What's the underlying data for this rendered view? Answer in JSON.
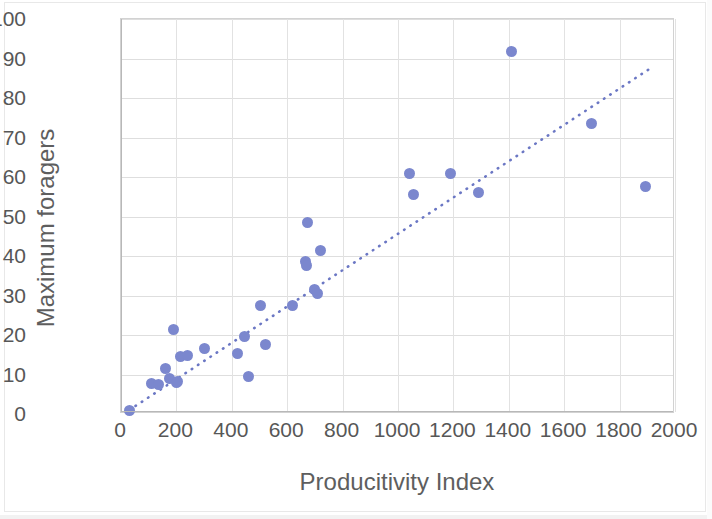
{
  "chart_data": {
    "type": "scatter",
    "title": "",
    "xlabel": "Producitivity Index",
    "ylabel": "Maximum foragers",
    "xlim": [
      0,
      2000
    ],
    "ylim": [
      0,
      100
    ],
    "xticks": [
      0,
      200,
      400,
      600,
      800,
      1000,
      1200,
      1400,
      1600,
      1800,
      2000
    ],
    "yticks": [
      0,
      10,
      20,
      30,
      40,
      50,
      60,
      70,
      80,
      90,
      100
    ],
    "grid": true,
    "legend": false,
    "marker_color": "#7b87ce",
    "trendline": {
      "style": "dotted",
      "color": "#6b77c4",
      "x_start": 30,
      "y_start": 0.5,
      "x_end": 1930,
      "y_end": 88.0
    },
    "series": [
      {
        "name": "colonies",
        "points": [
          [
            30,
            1.0
          ],
          [
            110,
            7.8
          ],
          [
            135,
            7.5
          ],
          [
            160,
            11.5
          ],
          [
            175,
            9.0
          ],
          [
            190,
            21.5
          ],
          [
            200,
            8.0
          ],
          [
            205,
            8.2
          ],
          [
            215,
            14.5
          ],
          [
            240,
            14.8
          ],
          [
            300,
            16.5
          ],
          [
            420,
            15.3
          ],
          [
            445,
            19.5
          ],
          [
            460,
            9.5
          ],
          [
            505,
            27.5
          ],
          [
            520,
            17.5
          ],
          [
            620,
            27.5
          ],
          [
            665,
            38.5
          ],
          [
            670,
            37.5
          ],
          [
            675,
            48.5
          ],
          [
            700,
            31.5
          ],
          [
            710,
            30.5
          ],
          [
            720,
            41.5
          ],
          [
            1040,
            61.0
          ],
          [
            1055,
            55.5
          ],
          [
            1190,
            61.0
          ],
          [
            1290,
            56.0
          ],
          [
            1410,
            91.8
          ],
          [
            1700,
            73.5
          ],
          [
            1895,
            57.5
          ]
        ]
      }
    ]
  },
  "axes": {
    "x_tick_labels": [
      "0",
      "200",
      "400",
      "600",
      "800",
      "1000",
      "1200",
      "1400",
      "1600",
      "1800",
      "2000"
    ],
    "y_tick_labels": [
      "0",
      "10",
      "20",
      "30",
      "40",
      "50",
      "60",
      "70",
      "80",
      "90",
      "100"
    ]
  }
}
